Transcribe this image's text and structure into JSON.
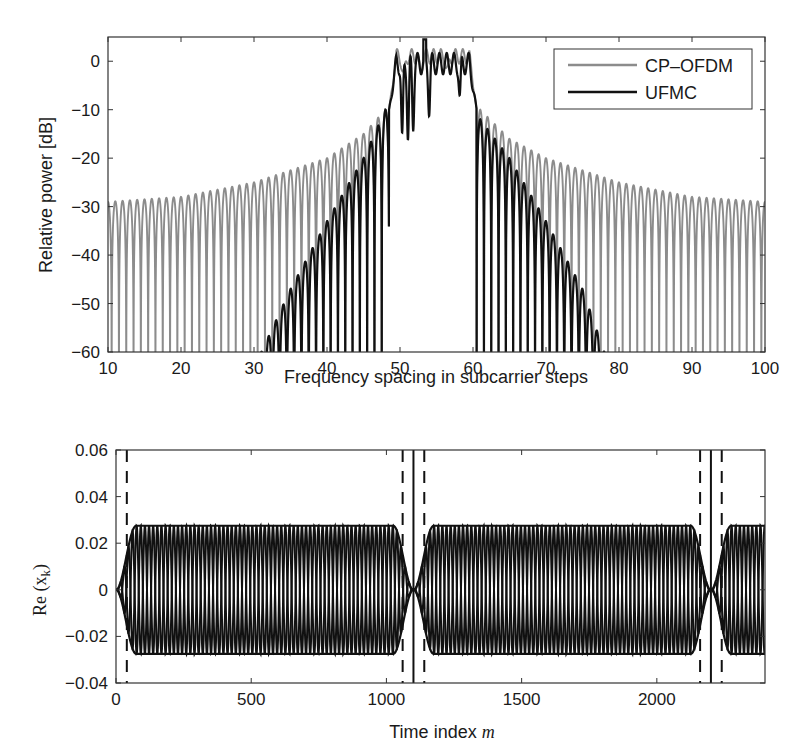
{
  "figure": {
    "caption_visible": false
  },
  "chart_data": [
    {
      "id": "spectrum",
      "type": "line",
      "title": "",
      "xlabel": "Frequency spacing in subcarrier steps",
      "ylabel": "Relative power [dB]",
      "xlim": [
        10,
        100
      ],
      "ylim": [
        -60,
        5
      ],
      "xticks": [
        10,
        20,
        30,
        40,
        50,
        60,
        70,
        80,
        90,
        100
      ],
      "xtick_labels": [
        "10",
        "20",
        "30",
        "40",
        "50",
        "60",
        "70",
        "80",
        "90",
        "100"
      ],
      "yticks": [
        0,
        -10,
        -20,
        -30,
        -40,
        -50,
        -60
      ],
      "ytick_labels": [
        "0",
        "−10",
        "−20",
        "−30",
        "−40",
        "−50",
        "−60"
      ],
      "grid": false,
      "legend": {
        "position": "upper right",
        "entries": [
          {
            "label": "CP–OFDM",
            "color": "#8c8c8c"
          },
          {
            "label": "UFMC",
            "color": "#111111"
          }
        ]
      },
      "passband": {
        "start": 48.5,
        "end": 60.5,
        "level_db": 0
      },
      "series": [
        {
          "name": "CP–OFDM",
          "color": "#8c8c8c",
          "description": "sidelobe envelope decays slowly from about -10 dB near the band edge to about -29 dB at the plot edges; peaks of +3 to +4 dB in band",
          "envelope_points": [
            [
              10,
              -29
            ],
            [
              20,
              -28
            ],
            [
              30,
              -25
            ],
            [
              40,
              -20
            ],
            [
              45,
              -15
            ],
            [
              48,
              -10
            ],
            [
              61,
              -10
            ],
            [
              65,
              -16
            ],
            [
              70,
              -20
            ],
            [
              80,
              -25
            ],
            [
              90,
              -28
            ],
            [
              100,
              -29
            ]
          ],
          "sidelobe_period": 1.0
        },
        {
          "name": "UFMC",
          "color": "#111111",
          "description": "sidelobes decay steeply, reaching -60 dB near subcarrier 31 on the left and 78 on the right",
          "envelope_points": [
            [
              31,
              -60
            ],
            [
              35,
              -47
            ],
            [
              40,
              -33
            ],
            [
              45,
              -20
            ],
            [
              48,
              -10
            ],
            [
              61,
              -12
            ],
            [
              65,
              -20
            ],
            [
              70,
              -33
            ],
            [
              75,
              -47
            ],
            [
              78,
              -60
            ]
          ],
          "sidelobe_period": 1.0
        }
      ]
    },
    {
      "id": "time-signal",
      "type": "line",
      "title": "",
      "xlabel": "Time index",
      "xlabel_var": "m",
      "ylabel": "Re (x",
      "ylabel_sub": "k",
      "ylabel_close": ")",
      "xlim": [
        0,
        2400
      ],
      "ylim": [
        -0.04,
        0.06
      ],
      "xticks": [
        0,
        500,
        1000,
        1500,
        2000
      ],
      "xtick_labels": [
        "0",
        "500",
        "1000",
        "1500",
        "2000"
      ],
      "yticks": [
        0.06,
        0.04,
        0.02,
        0,
        -0.02,
        -0.04
      ],
      "ytick_labels": [
        "0.06",
        "0.04",
        "0.02",
        "0",
        "−0.02",
        "−0.04"
      ],
      "grid": false,
      "amplitude": 0.0275,
      "symbol_length": 1100,
      "ramp_length": 75,
      "cycles_per_symbol": 36,
      "symbol_boundaries_solid": [
        1100,
        2200
      ],
      "filter_edges_dashed": [
        40,
        1060,
        1140,
        2160,
        2240
      ],
      "series": [
        {
          "name": "Re(x_k)",
          "color": "#111111"
        }
      ]
    }
  ]
}
